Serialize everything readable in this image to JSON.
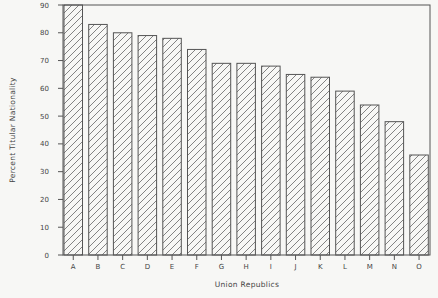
{
  "chart_data": {
    "type": "bar",
    "title": "",
    "xlabel": "Union Republics",
    "ylabel": "Percent Titular Nationality",
    "categories": [
      "A",
      "B",
      "C",
      "D",
      "E",
      "F",
      "G",
      "H",
      "I",
      "J",
      "K",
      "L",
      "M",
      "N",
      "O"
    ],
    "values": [
      90,
      83,
      80,
      79,
      78,
      74,
      69,
      69,
      68,
      65,
      64,
      59,
      54,
      48,
      36
    ],
    "ylim": [
      0,
      90
    ],
    "yticks": [
      0,
      10,
      20,
      30,
      40,
      50,
      60,
      70,
      80,
      90
    ],
    "grid": false,
    "legend": null,
    "bar_fill": "diagonal-hatch",
    "colors": {
      "stroke": "#555555",
      "background": "#f7f7f5",
      "text": "#444444"
    }
  }
}
